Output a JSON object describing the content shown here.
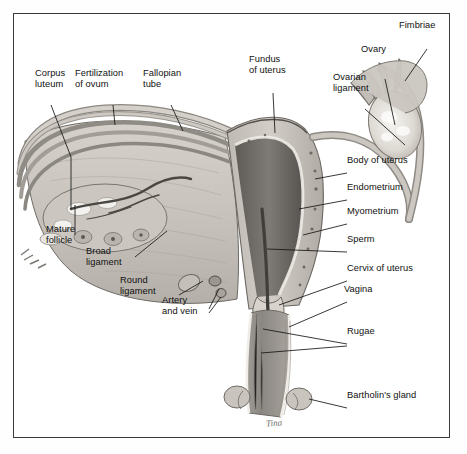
{
  "figure": {
    "signature": "Tina",
    "border_color": "#3a3a3a",
    "background_color": "#ffffff",
    "tissue_color": "#c9c5be",
    "cavity_color": "#6f6b66",
    "highlight_color": "#f2f0ec"
  },
  "labels": [
    {
      "id": "corpus-luteum",
      "text": "Corpus\nluteum",
      "x": 22,
      "y": 68,
      "align": "left"
    },
    {
      "id": "fertilization",
      "text": "Fertilization\nof ovum",
      "x": 72,
      "y": 68,
      "align": "left"
    },
    {
      "id": "fallopian-tube",
      "text": "Fallopian\ntube",
      "x": 140,
      "y": 68,
      "align": "left"
    },
    {
      "id": "fundus-of-uterus",
      "text": "Fundus\nof uterus",
      "x": 246,
      "y": 54,
      "align": "left"
    },
    {
      "id": "ovarian-ligament",
      "text": "Ovarian\nligament",
      "x": 330,
      "y": 72,
      "align": "left"
    },
    {
      "id": "ovary",
      "text": "Ovary",
      "x": 358,
      "y": 48,
      "align": "left"
    },
    {
      "id": "fimbriae",
      "text": "Fimbriae",
      "x": 396,
      "y": 22,
      "align": "left"
    },
    {
      "id": "body-of-uterus",
      "text": "Body of uterus",
      "x": 338,
      "y": 157,
      "align": "left"
    },
    {
      "id": "endometrium",
      "text": "Endometrium",
      "x": 338,
      "y": 184,
      "align": "left"
    },
    {
      "id": "myometrium",
      "text": "Myometrium",
      "x": 338,
      "y": 208,
      "align": "left"
    },
    {
      "id": "sperm",
      "text": "Sperm",
      "x": 338,
      "y": 236,
      "align": "left"
    },
    {
      "id": "cervix-of-uterus",
      "text": "Cervix of uterus",
      "x": 338,
      "y": 265,
      "align": "left"
    },
    {
      "id": "vagina",
      "text": "Vagina",
      "x": 338,
      "y": 286,
      "align": "left"
    },
    {
      "id": "rugae",
      "text": "Rugae",
      "x": 338,
      "y": 328,
      "align": "left"
    },
    {
      "id": "bartholins-gland",
      "text": "Bartholin's gland",
      "x": 338,
      "y": 392,
      "align": "left"
    },
    {
      "id": "mature-follicle",
      "text": "Mature\nfollicle",
      "x": 44,
      "y": 224,
      "align": "left"
    },
    {
      "id": "broad-ligament",
      "text": "Broad\nligament",
      "x": 84,
      "y": 246,
      "align": "left"
    },
    {
      "id": "round-ligament",
      "text": "Round\nligament",
      "x": 118,
      "y": 275,
      "align": "left"
    },
    {
      "id": "artery-and-vein",
      "text": "Artery\nand vein",
      "x": 160,
      "y": 295,
      "align": "left"
    }
  ],
  "structures": [
    {
      "id": "ovary-right",
      "name": "Right ovary with follicles"
    },
    {
      "id": "fimbriae-right",
      "name": "Fimbriae of infundibulum"
    },
    {
      "id": "fallopian-tube",
      "name": "Fallopian (uterine) tube"
    },
    {
      "id": "uterus-body",
      "name": "Body of uterus"
    },
    {
      "id": "endometrium-layer",
      "name": "Endometrium lining"
    },
    {
      "id": "myometrium-layer",
      "name": "Myometrium muscle wall"
    },
    {
      "id": "uterine-cavity",
      "name": "Uterine cavity"
    },
    {
      "id": "cervix",
      "name": "Cervix of uterus"
    },
    {
      "id": "vaginal-canal",
      "name": "Vaginal canal with rugae"
    },
    {
      "id": "bartholins-gland",
      "name": "Bartholin's gland"
    },
    {
      "id": "broad-ligament",
      "name": "Broad ligament"
    },
    {
      "id": "round-ligament",
      "name": "Round ligament"
    },
    {
      "id": "ovary-left",
      "name": "Left ovary, sectioned"
    },
    {
      "id": "sperm-path",
      "name": "Sperm migration path"
    }
  ]
}
